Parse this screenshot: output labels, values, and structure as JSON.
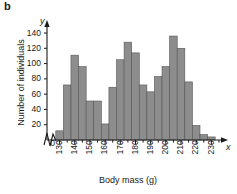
{
  "panel": {
    "label": "b"
  },
  "axis_symbols": {
    "y": "y",
    "x": "x"
  },
  "chart_data": {
    "type": "bar",
    "title": "",
    "xlabel": "Body mass (g)",
    "ylabel": "Number of individuals",
    "xlim": [
      125,
      237
    ],
    "ylim": [
      0,
      148
    ],
    "grid": false,
    "legend": null,
    "bin_width": 5,
    "axis_break_y": true,
    "bar_color": "#8d8d8d",
    "bar_edge_color": "#555555",
    "axis_color": "#1a1a1a",
    "ytick_values": [
      0,
      20,
      40,
      60,
      80,
      100,
      120,
      140
    ],
    "ytick_labels": [
      "0",
      "20",
      "40",
      "60",
      "80",
      "100",
      "120",
      "140"
    ],
    "xtick_values": [
      130,
      140,
      150,
      160,
      170,
      180,
      190,
      200,
      210,
      220,
      230
    ],
    "xtick_labels": [
      "130",
      "140",
      "150",
      "160",
      "170",
      "180",
      "190",
      "200",
      "210",
      "220",
      "230"
    ],
    "xminor_step": 5,
    "bins": [
      {
        "start": 127.5,
        "end": 132.5,
        "center": 130,
        "value": 12
      },
      {
        "start": 132.5,
        "end": 137.5,
        "center": 135,
        "value": 72
      },
      {
        "start": 137.5,
        "end": 142.5,
        "center": 140,
        "value": 111
      },
      {
        "start": 142.5,
        "end": 147.5,
        "center": 145,
        "value": 96
      },
      {
        "start": 147.5,
        "end": 152.5,
        "center": 150,
        "value": 51
      },
      {
        "start": 152.5,
        "end": 157.5,
        "center": 155,
        "value": 51
      },
      {
        "start": 157.5,
        "end": 162.5,
        "center": 160,
        "value": 21
      },
      {
        "start": 162.5,
        "end": 167.5,
        "center": 165,
        "value": 69
      },
      {
        "start": 167.5,
        "end": 172.5,
        "center": 170,
        "value": 105
      },
      {
        "start": 172.5,
        "end": 177.5,
        "center": 175,
        "value": 128
      },
      {
        "start": 177.5,
        "end": 182.5,
        "center": 180,
        "value": 114
      },
      {
        "start": 182.5,
        "end": 187.5,
        "center": 185,
        "value": 72
      },
      {
        "start": 187.5,
        "end": 192.5,
        "center": 190,
        "value": 63
      },
      {
        "start": 192.5,
        "end": 197.5,
        "center": 195,
        "value": 83
      },
      {
        "start": 197.5,
        "end": 202.5,
        "center": 200,
        "value": 96
      },
      {
        "start": 202.5,
        "end": 207.5,
        "center": 205,
        "value": 136
      },
      {
        "start": 207.5,
        "end": 212.5,
        "center": 210,
        "value": 120
      },
      {
        "start": 212.5,
        "end": 217.5,
        "center": 215,
        "value": 76
      },
      {
        "start": 217.5,
        "end": 222.5,
        "center": 220,
        "value": 19
      },
      {
        "start": 222.5,
        "end": 227.5,
        "center": 225,
        "value": 7
      },
      {
        "start": 227.5,
        "end": 232.5,
        "center": 230,
        "value": 4
      }
    ]
  }
}
